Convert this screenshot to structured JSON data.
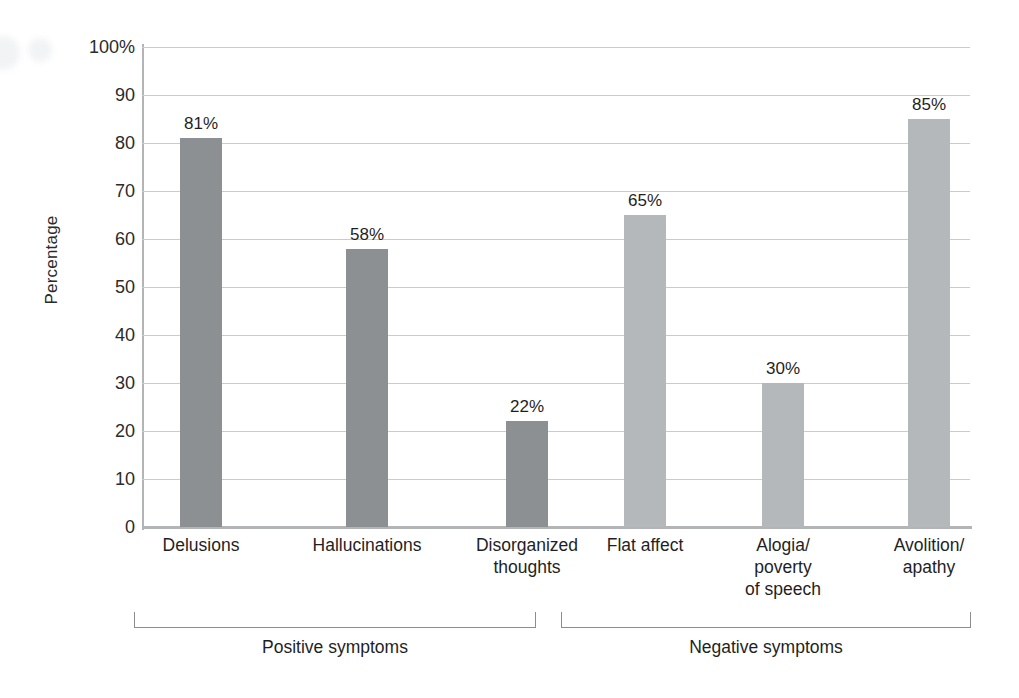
{
  "chart_data": {
    "type": "bar",
    "title": "",
    "xlabel": "",
    "ylabel": "Percentage",
    "ylim": [
      0,
      100
    ],
    "grid": true,
    "legend": "none",
    "categories": [
      "Delusions",
      "Hallucinations",
      "Disorganized\nthoughts",
      "Flat affect",
      "Alogia/\npoverty\nof speech",
      "Avolition/\napathy"
    ],
    "values": [
      81,
      58,
      22,
      65,
      30,
      85
    ],
    "value_labels": [
      "81%",
      "58%",
      "22%",
      "65%",
      "30%",
      "85%"
    ],
    "y_ticks": [
      "100%",
      "90",
      "80",
      "70",
      "60",
      "50",
      "40",
      "30",
      "20",
      "10",
      "0"
    ],
    "y_tick_values": [
      100,
      90,
      80,
      70,
      60,
      50,
      40,
      30,
      20,
      10,
      0
    ],
    "groups": [
      {
        "label": "Positive symptoms",
        "categories": [
          "Delusions",
          "Hallucinations",
          "Disorganized thoughts"
        ],
        "color": "#8d9092"
      },
      {
        "label": "Negative symptoms",
        "categories": [
          "Flat affect",
          "Alogia/poverty of speech",
          "Avolition/apathy"
        ],
        "color": "#b5b8ba"
      }
    ],
    "bar_colors": [
      "#8d9092",
      "#8d9092",
      "#8d9092",
      "#b5b8ba",
      "#b5b8ba",
      "#b5b8ba"
    ]
  },
  "colors": {
    "positive_bar": "#8d9092",
    "negative_bar": "#b5b8ba",
    "gridline": "#c9cbcd",
    "axis": "#b2b4b6",
    "text": "#1f1f1f",
    "background": "#ffffff"
  }
}
